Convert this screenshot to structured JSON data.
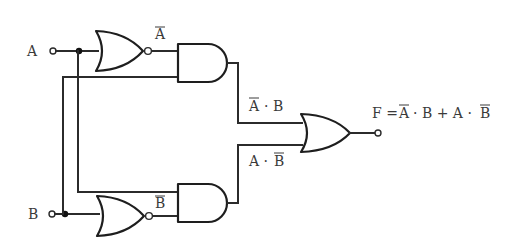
{
  "diagram": {
    "type": "logic-circuit",
    "inputs": [
      {
        "name": "A",
        "label": "A"
      },
      {
        "name": "B",
        "label": "B"
      }
    ],
    "gates": [
      {
        "id": "inv_a",
        "kind": "NOR",
        "output_label": "A",
        "output_overbar": true
      },
      {
        "id": "and_top",
        "kind": "AND",
        "output_label_parts": [
          "A",
          " · B"
        ],
        "overbar_part": 0
      },
      {
        "id": "inv_b",
        "kind": "NOR",
        "output_label": "B",
        "output_overbar": true
      },
      {
        "id": "and_bottom",
        "kind": "AND",
        "output_label_parts": [
          "A · ",
          "B"
        ],
        "overbar_part": 1
      },
      {
        "id": "or_out",
        "kind": "OR"
      }
    ],
    "labels": {
      "input_a": "A",
      "input_b": "B",
      "not_a": "A",
      "not_b": "B",
      "term1_a": "A",
      "term1_rest": "· B",
      "term2_a": "A ·",
      "term2_b": "B",
      "formula_f": "F =",
      "formula_a1": "A",
      "formula_mid": "· B + A ·",
      "formula_b2": "B"
    },
    "output": {
      "name": "F",
      "expression": "F = A̅·B + A·B̅"
    },
    "colors": {
      "line": "#2b2b2b",
      "text": "#3a3a3a",
      "background": "#ffffff"
    }
  }
}
